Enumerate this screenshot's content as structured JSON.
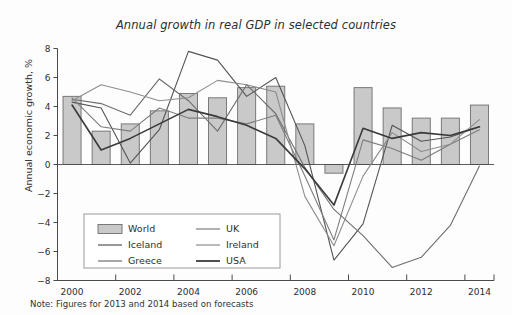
{
  "chart_data": {
    "type": "bar",
    "title": "Annual growth in real GDP in selected countries",
    "xlabel": "",
    "ylabel": "Annual economic growth, %",
    "ylim": [
      -8,
      8
    ],
    "ytick_step": 2,
    "xlim": [
      2000,
      2014
    ],
    "xtick_step": 2,
    "grid": false,
    "legend_position": "lower-left-inside",
    "note": "Note: Figures for 2013 and 2014 based on forecasts",
    "categories": [
      2000,
      2001,
      2002,
      2003,
      2004,
      2005,
      2006,
      2007,
      2008,
      2009,
      2010,
      2011,
      2012,
      2013,
      2014
    ],
    "xtick_labels": [
      "2000",
      "2002",
      "2004",
      "2006",
      "2008",
      "2010",
      "2012",
      "2014"
    ],
    "ytick_labels": [
      "8",
      "6",
      "4",
      "2",
      "0",
      "-2",
      "-4",
      "-6",
      "-8"
    ],
    "bar_series": {
      "name": "World",
      "values": [
        4.7,
        2.3,
        2.8,
        3.7,
        4.9,
        4.6,
        5.3,
        5.4,
        2.8,
        -0.6,
        5.3,
        3.9,
        3.2,
        3.2,
        4.1
      ],
      "fill": "#c9c9c9",
      "stroke": "#6e6e6e"
    },
    "series": [
      {
        "name": "Iceland",
        "color": "#545454",
        "width": 1.1,
        "values": [
          4.3,
          3.9,
          0.1,
          2.4,
          7.8,
          7.2,
          4.7,
          6.0,
          1.3,
          -6.6,
          -4.1,
          2.7,
          1.6,
          1.9,
          2.6
        ]
      },
      {
        "name": "Greece",
        "color": "#6d6d6d",
        "width": 1.1,
        "values": [
          4.5,
          4.2,
          3.4,
          5.9,
          4.4,
          2.3,
          5.5,
          3.5,
          -0.2,
          -3.1,
          -4.9,
          -7.1,
          -6.4,
          -4.2,
          -0.1
        ]
      },
      {
        "name": "UK",
        "color": "#7d7d7d",
        "width": 1.1,
        "values": [
          4.6,
          2.6,
          2.3,
          3.9,
          3.2,
          3.2,
          2.8,
          3.4,
          -0.8,
          -5.2,
          1.7,
          1.1,
          0.3,
          1.4,
          2.4
        ]
      },
      {
        "name": "Ireland",
        "color": "#8d8d8d",
        "width": 1.1,
        "values": [
          4.4,
          5.5,
          5.0,
          4.4,
          4.6,
          5.8,
          5.5,
          5.0,
          -2.2,
          -5.6,
          -0.8,
          2.2,
          0.9,
          1.4,
          3.1
        ]
      },
      {
        "name": "USA",
        "color": "#3a3a3a",
        "width": 1.6,
        "values": [
          4.1,
          1.0,
          1.8,
          2.8,
          3.8,
          3.3,
          2.7,
          1.8,
          -0.3,
          -2.8,
          2.5,
          1.8,
          2.2,
          2.0,
          2.6
        ]
      }
    ],
    "legend_entries": [
      {
        "label": "World",
        "type": "bar",
        "color": "#c9c9c9"
      },
      {
        "label": "UK",
        "type": "line",
        "color": "#7d7d7d"
      },
      {
        "label": "Iceland",
        "type": "line",
        "color": "#545454"
      },
      {
        "label": "Ireland",
        "type": "line",
        "color": "#8d8d8d"
      },
      {
        "label": "Greece",
        "type": "line",
        "color": "#6d6d6d"
      },
      {
        "label": "USA",
        "type": "line",
        "color": "#3a3a3a"
      }
    ]
  }
}
